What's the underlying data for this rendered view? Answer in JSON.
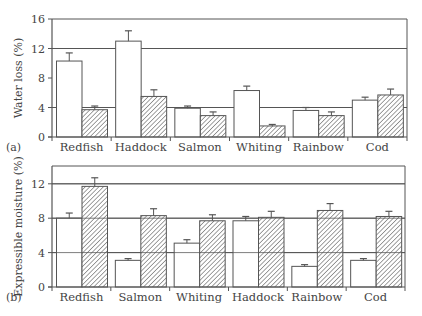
{
  "chart_data": [
    {
      "type": "bar",
      "panel_label": "(a)",
      "title": "",
      "xlabel": "",
      "ylabel": "Water loss (%)",
      "ylim": [
        0,
        16
      ],
      "yticks": [
        0,
        4,
        8,
        12,
        16
      ],
      "gridlines": [
        4,
        12
      ],
      "categories": [
        "Redfish",
        "Haddock",
        "Salmon",
        "Whiting",
        "Rainbow",
        "Cod"
      ],
      "series": [
        {
          "name": "white (open) bars",
          "fill": "#ffffff",
          "pattern": "none",
          "values": [
            10.3,
            13.0,
            3.9,
            6.3,
            3.6,
            5.0
          ],
          "errors": [
            1.1,
            1.4,
            0.3,
            0.6,
            0.4,
            0.4
          ]
        },
        {
          "name": "hatched bars",
          "fill": "#ffffff",
          "pattern": "diagonal-hatch",
          "values": [
            3.7,
            5.5,
            2.9,
            1.5,
            2.9,
            5.7
          ],
          "errors": [
            0.5,
            0.9,
            0.5,
            0.2,
            0.5,
            0.8
          ]
        }
      ]
    },
    {
      "type": "bar",
      "panel_label": "(b)",
      "title": "",
      "xlabel": "",
      "ylabel": "Expressible moisture (%)",
      "ylim": [
        0,
        14
      ],
      "yticks": [
        0,
        4,
        8,
        12
      ],
      "gridlines": [
        4,
        8,
        12
      ],
      "categories": [
        "Redfish",
        "Salmon",
        "Whiting",
        "Haddock",
        "Rainbow",
        "Cod"
      ],
      "series": [
        {
          "name": "white (open) bars",
          "fill": "#ffffff",
          "pattern": "none",
          "values": [
            8.0,
            3.1,
            5.1,
            7.7,
            2.4,
            3.1
          ],
          "errors": [
            0.6,
            0.2,
            0.4,
            0.5,
            0.2,
            0.2
          ]
        },
        {
          "name": "hatched bars",
          "fill": "#ffffff",
          "pattern": "diagonal-hatch",
          "values": [
            11.7,
            8.3,
            7.7,
            8.1,
            8.9,
            8.2
          ],
          "errors": [
            1.0,
            0.8,
            0.7,
            0.7,
            0.8,
            0.6
          ]
        }
      ]
    }
  ],
  "colors": {
    "line": "#555555",
    "hatch": "#555555",
    "background": "#ffffff"
  }
}
